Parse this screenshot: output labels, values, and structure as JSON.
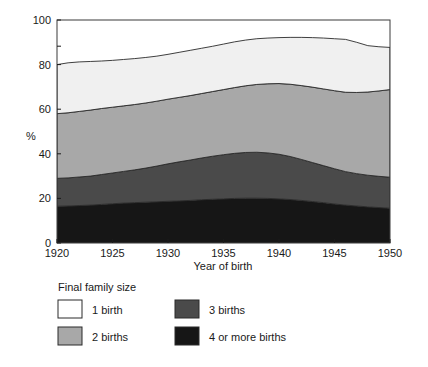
{
  "chart_data": {
    "type": "area",
    "title": "",
    "xlabel": "Year of birth",
    "ylabel": "%",
    "xlim": [
      1920,
      1950
    ],
    "ylim": [
      0,
      100
    ],
    "xticks": [
      1920,
      1925,
      1930,
      1935,
      1940,
      1945,
      1950
    ],
    "yticks": [
      0,
      20,
      40,
      60,
      80,
      100
    ],
    "xticklabels": [
      "1920",
      "1925",
      "1930",
      "1935",
      "1940",
      "1945",
      "1950"
    ],
    "yticklabels": [
      "0",
      "20",
      "40",
      "60",
      "80",
      "100"
    ],
    "grid": false,
    "stacked": true,
    "legend_title": "Final family size",
    "legend_position": "below-left",
    "x": [
      1920,
      1921,
      1922,
      1923,
      1924,
      1925,
      1926,
      1927,
      1928,
      1929,
      1930,
      1931,
      1932,
      1933,
      1934,
      1935,
      1936,
      1937,
      1938,
      1939,
      1940,
      1941,
      1942,
      1943,
      1944,
      1945,
      1946,
      1947,
      1948,
      1949,
      1950
    ],
    "series": [
      {
        "name": "4 or more births",
        "color": "#161616",
        "values": [
          16.5,
          16.6,
          16.8,
          17.0,
          17.3,
          17.6,
          17.9,
          18.1,
          18.3,
          18.5,
          18.7,
          18.9,
          19.1,
          19.4,
          19.6,
          19.8,
          20.0,
          20.1,
          20.1,
          20.0,
          19.8,
          19.5,
          19.1,
          18.6,
          18.1,
          17.5,
          17.0,
          16.6,
          16.2,
          15.9,
          15.6
        ]
      },
      {
        "name": "3 births",
        "color": "#4a4a4a",
        "values": [
          12.5,
          12.6,
          12.8,
          13.0,
          13.4,
          13.8,
          14.2,
          14.7,
          15.3,
          16.0,
          16.8,
          17.5,
          18.1,
          18.7,
          19.3,
          19.8,
          20.2,
          20.5,
          20.6,
          20.4,
          20.0,
          19.3,
          18.4,
          17.5,
          16.6,
          15.8,
          15.0,
          14.5,
          14.2,
          14.0,
          13.9
        ]
      },
      {
        "name": "2 births",
        "color": "#a8a8a8",
        "values": [
          29.0,
          29.2,
          29.4,
          29.6,
          29.6,
          29.5,
          29.4,
          29.3,
          29.2,
          29.1,
          29.0,
          28.9,
          28.9,
          28.9,
          29.0,
          29.2,
          29.5,
          29.9,
          30.4,
          31.0,
          31.7,
          32.4,
          33.1,
          33.8,
          34.4,
          35.0,
          35.6,
          36.4,
          37.3,
          38.3,
          39.3
        ]
      },
      {
        "name": "1 birth",
        "color": "#f0f0f0",
        "values": [
          22.0,
          22.4,
          22.2,
          21.8,
          21.3,
          21.0,
          20.8,
          20.6,
          20.4,
          20.2,
          20.1,
          20.2,
          20.3,
          20.3,
          20.3,
          20.4,
          20.5,
          20.5,
          20.5,
          20.5,
          20.6,
          21.0,
          21.6,
          22.2,
          22.8,
          23.3,
          23.7,
          22.5,
          20.8,
          19.8,
          18.9
        ]
      }
    ],
    "cumulative_top": [
      80.0,
      80.8,
      81.2,
      81.4,
      81.6,
      81.9,
      82.3,
      82.7,
      83.2,
      83.8,
      84.6,
      85.5,
      86.4,
      87.3,
      88.2,
      89.2,
      90.2,
      91.0,
      91.6,
      91.9,
      92.1,
      92.2,
      92.2,
      92.1,
      91.9,
      91.6,
      91.3,
      90.0,
      88.5,
      88.0,
      87.7
    ]
  },
  "legend": {
    "title": "Final family size",
    "items": [
      {
        "label": "1 birth",
        "color": "#ffffff"
      },
      {
        "label": "2 births",
        "color": "#a8a8a8"
      },
      {
        "label": "3 births",
        "color": "#4a4a4a"
      },
      {
        "label": "4 or more births",
        "color": "#161616"
      }
    ]
  },
  "axes": {
    "ylabel": "%",
    "xlabel": "Year of birth",
    "yticklabels": [
      "0",
      "20",
      "40",
      "60",
      "80",
      "100"
    ],
    "xticklabels": [
      "1920",
      "1925",
      "1930",
      "1935",
      "1940",
      "1945",
      "1950"
    ]
  }
}
